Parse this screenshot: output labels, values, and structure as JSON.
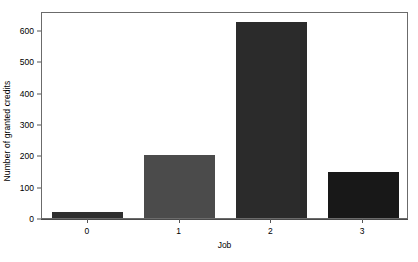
{
  "chart_data": {
    "type": "bar",
    "title": "",
    "subtitle": "",
    "xlabel": "Job",
    "ylabel": "Number of granted credits",
    "categories": [
      "0",
      "1",
      "2",
      "3"
    ],
    "values": [
      20,
      200,
      625,
      148
    ],
    "series": [
      {
        "name": "Number of granted credits",
        "values": [
          20,
          200,
          625,
          148
        ]
      }
    ],
    "bar_colors": [
      "#2f2f2f",
      "#4b4b4b",
      "#2b2b2b",
      "#181818"
    ],
    "ylim": [
      0,
      660
    ],
    "yticks": [
      0,
      100,
      200,
      300,
      400,
      500,
      600
    ],
    "ytick_labels": [
      "0",
      "100",
      "200",
      "300",
      "400",
      "500",
      "600"
    ],
    "xtick_labels": [
      "0",
      "1",
      "2",
      "3"
    ],
    "grid": false,
    "legend": null,
    "legend_position": "none",
    "frame": true,
    "background_color": "#ffffff",
    "axis_color": "#6b6b6b",
    "text_color": "#000000",
    "annotations": []
  },
  "figure": {
    "axis_title_x": "Job",
    "axis_title_y": "Number of granted credits"
  }
}
